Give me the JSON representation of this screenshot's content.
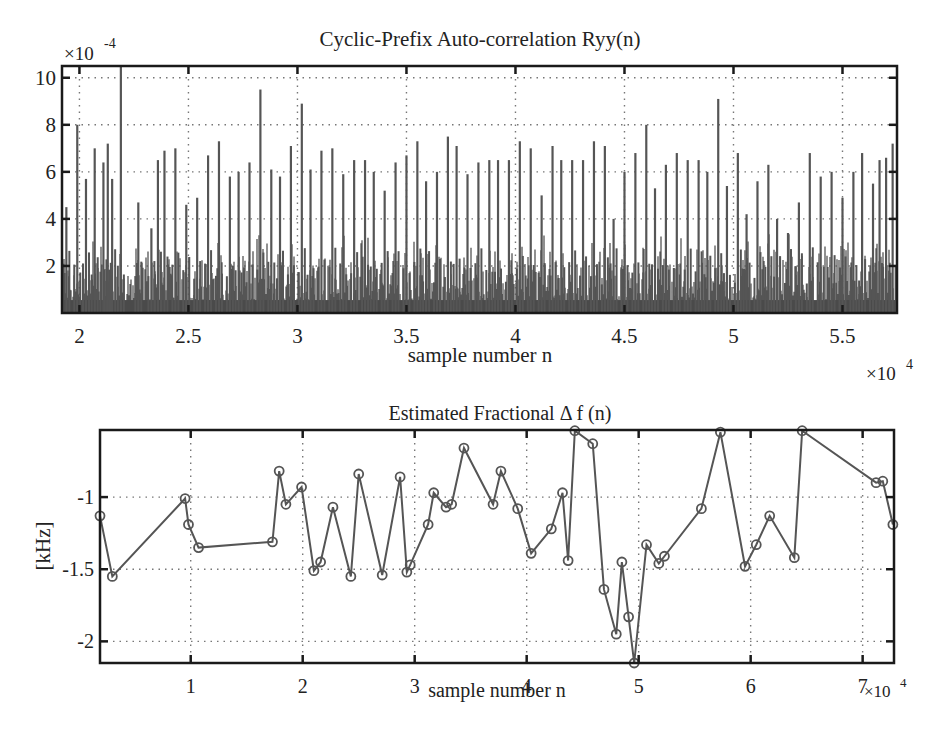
{
  "chart_data": [
    {
      "type": "bar",
      "title": "Cyclic-Prefix Auto-correlation Ryy(n)",
      "xlabel": "sample number n",
      "ylabel": "",
      "x_multiplier": "×10^4",
      "y_multiplier": "×10^-4",
      "xlim": [
        1.92,
        5.75
      ],
      "ylim": [
        0,
        10.5
      ],
      "xticks": [
        2,
        2.5,
        3,
        3.5,
        4,
        4.5,
        5,
        5.5
      ],
      "xtick_labels": [
        "2",
        "2.5",
        "3",
        "3.5",
        "4",
        "4.5",
        "5",
        "5.5"
      ],
      "yticks": [
        2,
        4,
        6,
        8,
        10
      ],
      "ytick_labels": [
        "2",
        "4",
        "6",
        "8",
        "10"
      ],
      "grid": true,
      "color": "#555555",
      "peaks": {
        "x": [
          1.94,
          1.99,
          2.03,
          2.07,
          2.11,
          2.13,
          2.15,
          2.19,
          2.27,
          2.33,
          2.36,
          2.39,
          2.44,
          2.49,
          2.54,
          2.59,
          2.64,
          2.69,
          2.73,
          2.78,
          2.83,
          2.88,
          2.92,
          2.97,
          3.02,
          3.06,
          3.11,
          3.16,
          3.21,
          3.26,
          3.31,
          3.35,
          3.4,
          3.45,
          3.5,
          3.55,
          3.59,
          3.64,
          3.69,
          3.73,
          3.78,
          3.83,
          3.88,
          3.92,
          3.97,
          4.02,
          4.07,
          4.12,
          4.17,
          4.21,
          4.26,
          4.31,
          4.36,
          4.41,
          4.45,
          4.5,
          4.55,
          4.6,
          4.64,
          4.69,
          4.74,
          4.79,
          4.84,
          4.88,
          4.93,
          4.97,
          5.02,
          5.06,
          5.11,
          5.16,
          5.2,
          5.25,
          5.3,
          5.35,
          5.4,
          5.45,
          5.5,
          5.55,
          5.59,
          5.64,
          5.67,
          5.7,
          5.73
        ],
        "values": [
          4.5,
          8.0,
          5.7,
          7.0,
          6.4,
          7.2,
          5.7,
          10.5,
          4.7,
          3.6,
          6.5,
          6.9,
          7.0,
          4.6,
          4.9,
          6.7,
          7.3,
          5.8,
          6.0,
          6.4,
          9.5,
          6.1,
          5.8,
          7.1,
          8.9,
          6.1,
          6.9,
          7.0,
          5.9,
          6.5,
          6.5,
          6.0,
          5.2,
          6.4,
          6.7,
          7.3,
          5.6,
          6.0,
          7.5,
          7.1,
          5.9,
          6.4,
          6.5,
          6.5,
          6.5,
          7.3,
          7.0,
          5.0,
          7.1,
          6.5,
          6.5,
          6.5,
          7.3,
          7.1,
          4.0,
          6.0,
          6.8,
          8.0,
          5.3,
          6.3,
          6.8,
          6.5,
          6.5,
          6.0,
          9.1,
          5.4,
          6.8,
          4.2,
          5.6,
          6.3,
          4.0,
          3.4,
          4.7,
          6.8,
          5.8,
          6.0,
          4.9,
          6.0,
          6.8,
          5.5,
          6.5,
          6.6,
          7.2
        ]
      },
      "noise_floor_level": 1.2
    },
    {
      "type": "line",
      "title": "Estimated Fractional Δ f (n)",
      "xlabel": "sample number n",
      "ylabel": "[kHz]",
      "x_multiplier": "×10^4",
      "xlim": [
        0.19,
        7.28
      ],
      "ylim": [
        -2.15,
        -0.535
      ],
      "xticks": [
        1,
        2,
        3,
        4,
        5,
        6,
        7
      ],
      "xtick_labels": [
        "1",
        "2",
        "3",
        "4",
        "5",
        "6",
        "7"
      ],
      "yticks": [
        -1,
        -1.5,
        -2
      ],
      "ytick_labels": [
        "-1",
        "-1.5",
        "-2"
      ],
      "grid": true,
      "marker": "circle",
      "color": "#555555",
      "x": [
        0.19,
        0.3,
        0.95,
        0.98,
        1.07,
        1.73,
        1.79,
        1.85,
        1.99,
        2.1,
        2.16,
        2.27,
        2.43,
        2.5,
        2.71,
        2.87,
        2.93,
        2.96,
        3.12,
        3.17,
        3.28,
        3.33,
        3.44,
        3.7,
        3.77,
        3.92,
        4.04,
        4.22,
        4.32,
        4.37,
        4.43,
        4.59,
        4.69,
        4.8,
        4.85,
        4.91,
        4.96,
        5.07,
        5.18,
        5.23,
        5.56,
        5.73,
        5.95,
        6.05,
        6.17,
        6.39,
        6.46,
        7.12,
        7.18,
        7.27
      ],
      "values": [
        -1.13,
        -1.55,
        -1.01,
        -1.19,
        -1.35,
        -1.31,
        -0.82,
        -1.05,
        -0.93,
        -1.51,
        -1.45,
        -1.07,
        -1.55,
        -0.84,
        -1.54,
        -0.86,
        -1.52,
        -1.47,
        -1.19,
        -0.97,
        -1.07,
        -1.05,
        -0.66,
        -1.05,
        -0.82,
        -1.08,
        -1.39,
        -1.22,
        -0.97,
        -1.44,
        -0.54,
        -0.63,
        -1.64,
        -1.95,
        -1.45,
        -1.83,
        -2.15,
        -1.33,
        -1.46,
        -1.41,
        -1.08,
        -0.55,
        -1.48,
        -1.33,
        -1.13,
        -1.42,
        -0.54,
        -0.9,
        -0.89,
        -1.19
      ]
    }
  ]
}
